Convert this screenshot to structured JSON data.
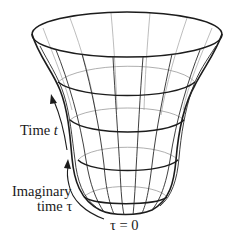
{
  "figure": {
    "labels": {
      "time_t": "Time",
      "time_t_var": "t",
      "imaginary_time_line1": "Imaginary",
      "imaginary_time_line2": "time",
      "imaginary_time_var": "τ",
      "tau_zero": "τ = 0"
    },
    "arrows": [
      {
        "name": "time-arrow",
        "direction": "up",
        "label_ref": "time_t"
      },
      {
        "name": "imaginary-time-arrow",
        "direction": "up",
        "label_ref": "imaginary_time"
      }
    ],
    "colors": {
      "stroke": "#1c1c1c",
      "back_lines": "#9a9a9a",
      "background": "#ffffff"
    }
  }
}
